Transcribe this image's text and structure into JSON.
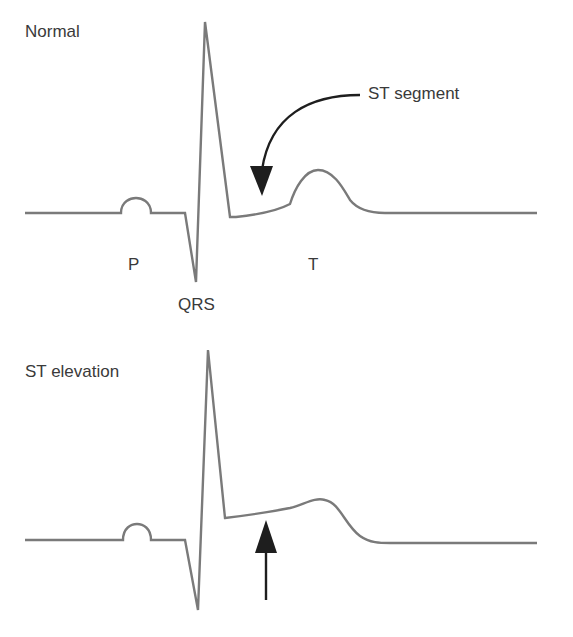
{
  "panels": [
    {
      "id": "normal",
      "title": "Normal",
      "wave_labels": {
        "p": "P",
        "qrs": "QRS",
        "t": "T"
      },
      "annotation": "ST segment"
    },
    {
      "id": "st_elevation",
      "title": "ST elevation"
    }
  ],
  "colors": {
    "trace": "#7a7a7a",
    "arrow": "#1e1e1e",
    "text": "#3a3a3a",
    "background": "#ffffff"
  }
}
